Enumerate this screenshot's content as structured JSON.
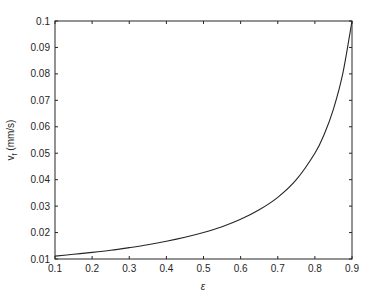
{
  "chart_data": {
    "type": "line",
    "title": "",
    "xlabel": "ε",
    "ylabel": "v",
    "ylabel_subscript": "f",
    "ylabel_unit": " (mm/s)",
    "xlim": [
      0.1,
      0.9
    ],
    "ylim": [
      0.01,
      0.1
    ],
    "grid": false,
    "legend": null,
    "xticks": [
      0.1,
      0.2,
      0.3,
      0.4,
      0.5,
      0.6,
      0.7,
      0.8,
      0.9
    ],
    "xtick_labels": [
      "0.1",
      "0.2",
      "0.3",
      "0.4",
      "0.5",
      "0.6",
      "0.7",
      "0.8",
      "0.9"
    ],
    "yticks": [
      0.01,
      0.02,
      0.03,
      0.04,
      0.05,
      0.06,
      0.07,
      0.08,
      0.09,
      0.1
    ],
    "ytick_labels": [
      "0.01",
      "0.02",
      "0.03",
      "0.04",
      "0.05",
      "0.06",
      "0.07",
      "0.08",
      "0.09",
      "0.1"
    ],
    "series": [
      {
        "name": "v_f",
        "color": "#262626",
        "x": [
          0.1,
          0.15,
          0.2,
          0.25,
          0.3,
          0.35,
          0.4,
          0.45,
          0.5,
          0.55,
          0.6,
          0.65,
          0.7,
          0.75,
          0.8,
          0.825,
          0.85,
          0.875,
          0.9
        ],
        "values": [
          0.0111,
          0.0118,
          0.0125,
          0.0133,
          0.0143,
          0.0154,
          0.0167,
          0.0182,
          0.02,
          0.0222,
          0.025,
          0.0286,
          0.0333,
          0.04,
          0.05,
          0.0571,
          0.0667,
          0.08,
          0.1
        ]
      }
    ]
  },
  "colors": {
    "axis": "#262626",
    "background": "#ffffff"
  }
}
